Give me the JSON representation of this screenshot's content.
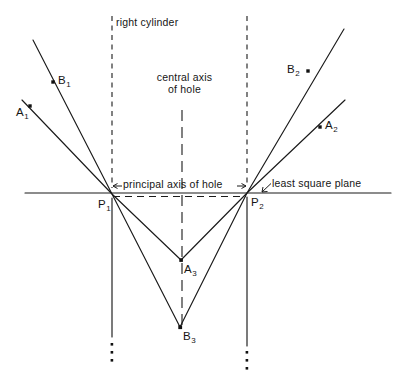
{
  "figure": {
    "background_color": "#ffffff",
    "line_color": "#1a1a1a",
    "width": 407,
    "height": 379
  },
  "labels": {
    "right_cylinder": "right cylinder",
    "central_axis_line1": "central axis",
    "central_axis_line2": "of hole",
    "principal_axis": "principal axis of hole",
    "least_square_plane": "least square plane"
  },
  "points": [
    {
      "id": "A1",
      "base": "A",
      "sub": "1",
      "x": 30,
      "y": 106
    },
    {
      "id": "B1",
      "base": "B",
      "sub": "1",
      "x": 53,
      "y": 82
    },
    {
      "id": "A2",
      "base": "A",
      "sub": "2",
      "x": 320,
      "y": 127
    },
    {
      "id": "B2",
      "base": "B",
      "sub": "2",
      "x": 308,
      "y": 71
    },
    {
      "id": "A3",
      "base": "A",
      "sub": "3",
      "x": 181,
      "y": 260
    },
    {
      "id": "B3",
      "base": "B",
      "sub": "3",
      "x": 180,
      "y": 327
    },
    {
      "id": "P1",
      "base": "P",
      "sub": "1",
      "x": 112,
      "y": 194
    },
    {
      "id": "P2",
      "base": "P",
      "sub": "2",
      "x": 247,
      "y": 193
    }
  ],
  "geometry": {
    "least_square_plane_line": {
      "x1": 25,
      "y1": 193,
      "x2": 391,
      "y2": 193
    },
    "principal_axis_line": {
      "x1": 112,
      "y1": 196,
      "x2": 247,
      "y2": 196
    },
    "cylinder_left_wall": {
      "x": 112,
      "y1": 16,
      "y2": 336
    },
    "cylinder_right_wall": {
      "x": 247,
      "y1": 16,
      "y2": 345
    },
    "central_axis_of_hole": {
      "x": 182,
      "y1": 110,
      "y2": 330
    },
    "ray_B1_P1_B3": [
      [
        33,
        40
      ],
      [
        112,
        194
      ],
      [
        180,
        327
      ]
    ],
    "ray_A1_P1_A3": [
      [
        22,
        100
      ],
      [
        112,
        194
      ],
      [
        181,
        260
      ]
    ],
    "ray_A3_P2_A2": [
      [
        181,
        260
      ],
      [
        247,
        193
      ],
      [
        345,
        100
      ]
    ],
    "ray_B3_P2_B2": [
      [
        180,
        327
      ],
      [
        247,
        193
      ],
      [
        344,
        29
      ]
    ],
    "ellipsis_left": {
      "x": 112,
      "ys": [
        344,
        352,
        360
      ]
    },
    "ellipsis_right": {
      "x": 247,
      "ys": [
        352,
        360,
        368
      ]
    }
  }
}
